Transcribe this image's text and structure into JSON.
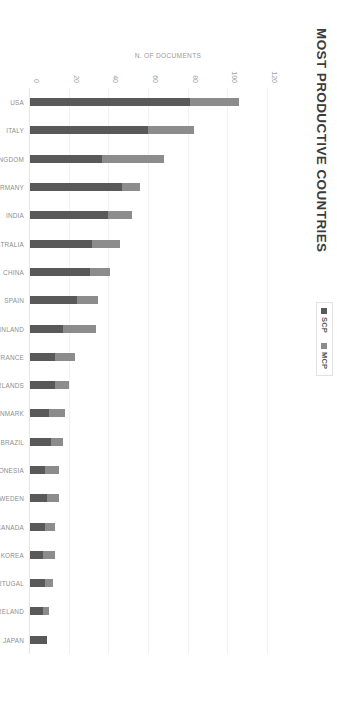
{
  "chart_data": {
    "type": "bar",
    "title": "MOST PRODUCTIVE COUNTRIES",
    "xlabel": "COUNTRY",
    "ylabel": "N. OF DOCUMENTS",
    "ylim": [
      0,
      120
    ],
    "yticks": [
      "0",
      "20",
      "40",
      "60",
      "80",
      "100",
      "120"
    ],
    "ytick_values": [
      0,
      20,
      40,
      60,
      80,
      100,
      120
    ],
    "grid": true,
    "orientation": "vertical-bars-rotated-90",
    "stacked": true,
    "legend_position": "top-center",
    "categories": [
      "USA",
      "ITALY",
      "UNITED KINGDOM",
      "GERMANY",
      "INDIA",
      "AUSTRALIA",
      "CHINA",
      "SPAIN",
      "FINLAND",
      "FRANCE",
      "NETHERLANDS",
      "DENMARK",
      "BRAZIL",
      "INDONESIA",
      "SWEDEN",
      "CANADA",
      "KOREA",
      "PORTUGAL",
      "IRELAND",
      "JAPAN"
    ],
    "series": [
      {
        "name": "SCP",
        "color": "#595959",
        "values": [
          81,
          60,
          37,
          47,
          40,
          32,
          31,
          24,
          17,
          13,
          13,
          10,
          11,
          8,
          9,
          8,
          7,
          8,
          7,
          9
        ]
      },
      {
        "name": "MCP",
        "color": "#8c8c8c",
        "values": [
          25,
          23,
          31,
          9,
          12,
          14,
          10,
          11,
          17,
          10,
          7,
          8,
          6,
          7,
          6,
          5,
          6,
          4,
          3,
          0
        ]
      }
    ],
    "totals": [
      106,
      83,
      68,
      56,
      52,
      46,
      41,
      35,
      34,
      23,
      20,
      18,
      17,
      15,
      15,
      13,
      13,
      12,
      10,
      9
    ]
  },
  "legend": {
    "items": [
      {
        "label": "SCP",
        "color": "#595959"
      },
      {
        "label": "MCP",
        "color": "#8c8c8c"
      }
    ]
  }
}
